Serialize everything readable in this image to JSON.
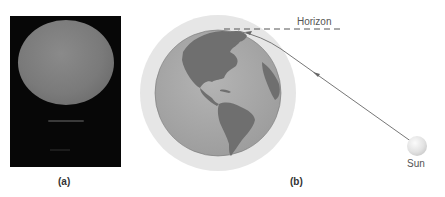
{
  "panel_a": {
    "label": "(a)",
    "description": "Photograph of the flattened Sun setting over water"
  },
  "panel_b": {
    "label": "(b)",
    "horizon_label": "Horizon",
    "sun_label": "Sun",
    "description": "Earth with atmosphere; light ray from Sun bends through atmosphere toward observer at horizon"
  },
  "colors": {
    "photo_bg": "#070707",
    "atmosphere": "#e6e6e6",
    "earth_ocean": "#a9a9a9",
    "earth_land": "#6e6e6e",
    "ray": "#777777",
    "sun": "#e0e0e0"
  }
}
